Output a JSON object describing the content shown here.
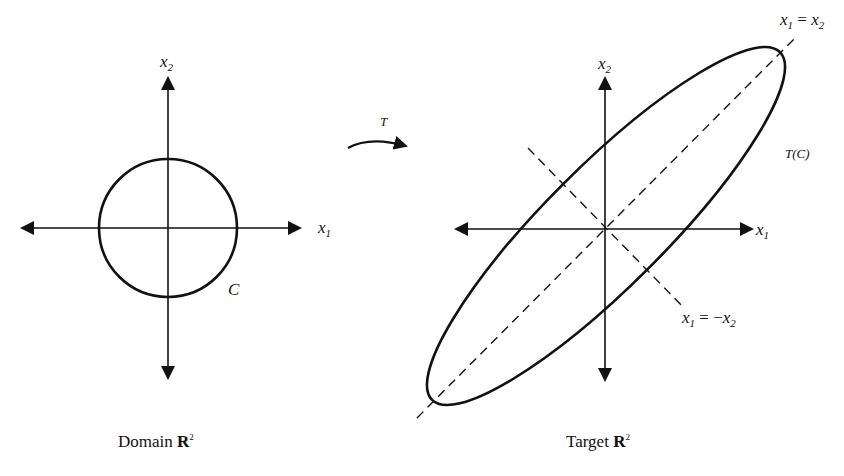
{
  "domain_figure": {
    "left_panel": {
      "caption": "Domain",
      "caption_space": "R",
      "caption_power": "2",
      "x_axis_label": "x",
      "x_axis_sub": "1",
      "y_axis_label": "x",
      "y_axis_sub": "2",
      "curve_label": "C",
      "shape": "circle"
    },
    "map_arrow": {
      "label": "T"
    },
    "right_panel": {
      "caption": "Target",
      "caption_space": "R",
      "caption_power": "2",
      "x_axis_label": "x",
      "x_axis_sub": "1",
      "y_axis_label": "x",
      "y_axis_sub": "2",
      "curve_label": "T(C)",
      "shape": "ellipse",
      "diag_line_1": {
        "lhs": "x",
        "lhs_sub": "1",
        "op": " = ",
        "rhs": "x",
        "rhs_sub": "2"
      },
      "diag_line_2": {
        "lhs": "x",
        "lhs_sub": "1",
        "op": " = −",
        "rhs": "x",
        "rhs_sub": "2"
      }
    }
  },
  "colors": {
    "ink": "#111111",
    "background": "#ffffff"
  }
}
